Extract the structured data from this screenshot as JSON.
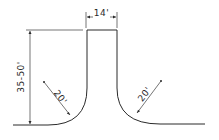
{
  "diagram": {
    "type": "cul-de-sac-street-section",
    "labels": {
      "width": "14'",
      "length": "35-50'",
      "radius_left": "20'",
      "radius_right": "20'"
    },
    "colors": {
      "line": "#2a2a2a",
      "background": "#ffffff"
    }
  }
}
